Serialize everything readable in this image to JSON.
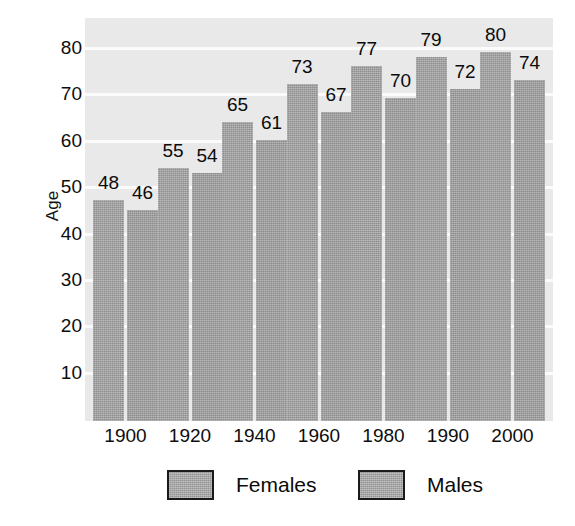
{
  "chart_data": {
    "type": "bar",
    "title": "",
    "xlabel": "",
    "ylabel": "Age",
    "categories": [
      "1900",
      "1920",
      "1940",
      "1960",
      "1980",
      "1990",
      "2000"
    ],
    "series": [
      {
        "name": "Females",
        "values": [
          48,
          55,
          65,
          73,
          77,
          79,
          80
        ]
      },
      {
        "name": "Males",
        "values": [
          46,
          54,
          61,
          67,
          70,
          72,
          74
        ]
      }
    ],
    "ylim": [
      0,
      84
    ],
    "yticks": [
      10,
      20,
      30,
      40,
      50,
      60,
      70,
      80
    ],
    "ytick_labels": [
      "10",
      "20",
      "30",
      "40",
      "50",
      "60",
      "70",
      "80"
    ],
    "grid": true,
    "grid_orientation": "horizontal",
    "legend_position": "bottom",
    "data_labels": true,
    "colors": {
      "bar_female": "#9d9d9d",
      "bar_male": "#9a9a9a",
      "plot_background": "#e9e9e9",
      "gridline": "#fbfbfb",
      "text": "#0d0d0d",
      "legend_border": "#1a1a1a",
      "page_background": "#ffffff"
    }
  },
  "legend": {
    "items": [
      {
        "label": "Females"
      },
      {
        "label": "Males"
      }
    ]
  }
}
